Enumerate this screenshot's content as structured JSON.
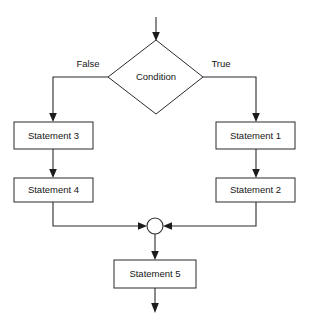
{
  "diagram": {
    "type": "flowchart",
    "canvas": {
      "width": 310,
      "height": 327,
      "background": "#ffffff"
    },
    "style": {
      "line_color": "#2b2b2b",
      "fill_color": "#ffffff",
      "text_color": "#171717"
    },
    "decision": {
      "label": "Condition",
      "shape": "diamond"
    },
    "branch_labels": {
      "false": "False",
      "true": "True"
    },
    "merge": {
      "label": "",
      "shape": "circle"
    },
    "nodes": [
      {
        "id": "statement3",
        "label": "Statement 3",
        "shape": "rectangle",
        "branch": "false",
        "order": 1
      },
      {
        "id": "statement4",
        "label": "Statement 4",
        "shape": "rectangle",
        "branch": "false",
        "order": 2
      },
      {
        "id": "statement1",
        "label": "Statement 1",
        "shape": "rectangle",
        "branch": "true",
        "order": 1
      },
      {
        "id": "statement2",
        "label": "Statement 2",
        "shape": "rectangle",
        "branch": "true",
        "order": 2
      },
      {
        "id": "statement5",
        "label": "Statement 5",
        "shape": "rectangle",
        "branch": "merged",
        "order": 1
      }
    ]
  }
}
